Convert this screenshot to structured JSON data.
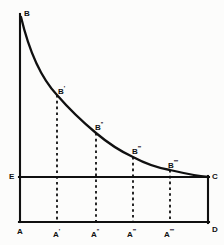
{
  "figure": {
    "background_color": "#fcfcfb",
    "ink_color": "#101010"
  },
  "chart_data": {
    "type": "line",
    "title": "",
    "xlabel": "",
    "ylabel": "",
    "grid": false,
    "legend": null,
    "xlim": [
      0,
      100
    ],
    "ylim": [
      0,
      100
    ],
    "series": [
      {
        "name": "BC curve",
        "style": "solid",
        "comment": "convex decreasing utility curve from B down to C",
        "x": [
          0,
          4,
          10,
          20,
          30,
          41,
          52,
          62,
          73,
          82,
          90,
          96,
          100
        ],
        "y": [
          100,
          88,
          74,
          58,
          48,
          40,
          33,
          28,
          23,
          19,
          16,
          13,
          11
        ]
      }
    ],
    "points": [
      {
        "key": "B",
        "label": "B",
        "primes": 0,
        "x": 0,
        "y": 100,
        "px": 21,
        "py": 18,
        "label_px": 24,
        "label_py": 10
      },
      {
        "key": "B1",
        "label": "B",
        "primes": 1,
        "x": 20,
        "y": 58,
        "px": 57,
        "py": 95,
        "label_px": 58,
        "label_py": 85
      },
      {
        "key": "B2",
        "label": "B",
        "primes": 2,
        "x": 41,
        "y": 40,
        "px": 96,
        "py": 133,
        "label_px": 95,
        "label_py": 121
      },
      {
        "key": "B3",
        "label": "B",
        "primes": 3,
        "x": 62,
        "y": 28,
        "px": 133,
        "py": 157,
        "label_px": 132,
        "label_py": 145
      },
      {
        "key": "B4",
        "label": "B",
        "primes": 4,
        "x": 82,
        "y": 19,
        "px": 170,
        "py": 170,
        "label_px": 168,
        "label_py": 159
      },
      {
        "key": "C",
        "label": "C",
        "primes": 0,
        "x": 100,
        "y": 11,
        "px": 208,
        "py": 177,
        "label_px": 212,
        "label_py": 173
      }
    ],
    "axis_labels": [
      {
        "key": "A",
        "label": "A",
        "primes": 0,
        "px": 17,
        "py": 228
      },
      {
        "key": "A1",
        "label": "A",
        "primes": 1,
        "px": 53,
        "py": 228
      },
      {
        "key": "A2",
        "label": "A",
        "primes": 2,
        "px": 91,
        "py": 228
      },
      {
        "key": "A3",
        "label": "A",
        "primes": 3,
        "px": 127,
        "py": 228
      },
      {
        "key": "A4",
        "label": "A",
        "primes": 4,
        "px": 164,
        "py": 228
      },
      {
        "key": "D",
        "label": "D",
        "primes": 0,
        "px": 212,
        "py": 226
      },
      {
        "key": "E",
        "label": "E",
        "primes": 0,
        "px": 9,
        "py": 173
      }
    ],
    "drop_lines": [
      {
        "key": "B1-A1",
        "x_px": 57,
        "y_top_px": 95,
        "y_bottom_px": 222
      },
      {
        "key": "B2-A2",
        "x_px": 96,
        "y_top_px": 133,
        "y_bottom_px": 222
      },
      {
        "key": "B3-A3",
        "x_px": 133,
        "y_top_px": 157,
        "y_bottom_px": 222
      },
      {
        "key": "B4-A4",
        "x_px": 170,
        "y_top_px": 170,
        "y_bottom_px": 222
      }
    ],
    "axes": {
      "vertical_axis": {
        "key": "AB",
        "x_px": 20,
        "y_top_px": 14,
        "y_bottom_px": 222
      },
      "horizontal_axis": {
        "key": "AD",
        "y_px": 222,
        "x_left_px": 20,
        "x_right_px": 208
      },
      "price_line": {
        "key": "EC",
        "y_px": 177,
        "x_left_px": 20,
        "x_right_px": 208
      },
      "right_edge": {
        "key": "CD",
        "x_px": 208,
        "y_top_px": 177,
        "y_bottom_px": 222
      }
    }
  }
}
